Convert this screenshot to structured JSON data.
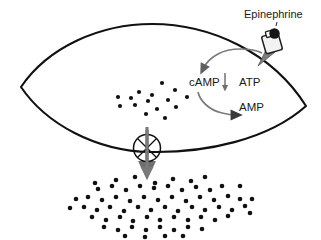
{
  "diagram": {
    "type": "cell-signaling-schematic",
    "background_color": "#ffffff",
    "labels": {
      "epinephrine": "Epinephrine",
      "camp": "cAMP",
      "atp": "ATP",
      "amp": "AMP"
    },
    "colors": {
      "outline": "#111111",
      "text": "#1a1a1a",
      "arrow_gray": "#6e6e6e",
      "arrow_gray_light": "#8a8a8a",
      "dot": "#111111",
      "receptor_fill": "#f2f2f2",
      "ligand_fill": "#161616"
    },
    "elements": {
      "cell_membrane": {
        "name": "cell-membrane-outline",
        "shape": "lens",
        "left_tip": [
          21,
          87
        ],
        "right_tip": [
          306,
          106
        ],
        "top_apex": [
          150,
          24
        ],
        "bottom_apex": [
          150,
          152
        ],
        "stroke_width": 2.1
      },
      "receptor": {
        "name": "membrane-receptor",
        "position": [
          272,
          42
        ],
        "shape": "transmembrane-protein"
      },
      "ligand": {
        "name": "epinephrine-ligand",
        "position": [
          274,
          35
        ],
        "radius": 5.2
      },
      "channel": {
        "name": "membrane-channel-pore",
        "center": [
          147,
          148
        ],
        "radius": 13.5
      },
      "efflux_arrow": {
        "name": "efflux-arrow",
        "from": [
          147,
          127
        ],
        "to": [
          147,
          176
        ],
        "color": "#7a7a7a"
      },
      "camp_down_arrow": {
        "name": "camp-decrease-arrow",
        "from": [
          225,
          74
        ],
        "to": [
          225,
          90
        ]
      }
    },
    "arcs": [
      {
        "name": "atp-to-camp-arc",
        "from_label": "ATP",
        "to_label": "cAMP",
        "direction": "counterclockwise-left"
      },
      {
        "name": "camp-to-amp-arc",
        "from_label": "cAMP",
        "to_label": "AMP",
        "direction": "clockwise-right"
      }
    ],
    "dots_inside": [
      [
        162,
        83
      ],
      [
        139,
        92
      ],
      [
        152,
        95
      ],
      [
        175,
        90
      ],
      [
        118,
        97
      ],
      [
        131,
        98
      ],
      [
        148,
        101
      ],
      [
        168,
        100
      ],
      [
        187,
        97
      ],
      [
        120,
        106
      ],
      [
        135,
        105
      ],
      [
        157,
        109
      ],
      [
        176,
        107
      ],
      [
        146,
        114
      ],
      [
        165,
        118
      ]
    ],
    "dots_outside": [
      [
        116,
        180
      ],
      [
        135,
        177
      ],
      [
        155,
        183
      ],
      [
        173,
        179
      ],
      [
        191,
        181
      ],
      [
        205,
        177
      ],
      [
        98,
        189
      ],
      [
        112,
        186
      ],
      [
        126,
        190
      ],
      [
        140,
        186
      ],
      [
        154,
        188
      ],
      [
        168,
        186
      ],
      [
        182,
        190
      ],
      [
        196,
        187
      ],
      [
        210,
        190
      ],
      [
        222,
        186
      ],
      [
        88,
        197
      ],
      [
        102,
        200
      ],
      [
        116,
        197
      ],
      [
        130,
        201
      ],
      [
        144,
        197
      ],
      [
        158,
        200
      ],
      [
        172,
        197
      ],
      [
        186,
        201
      ],
      [
        200,
        197
      ],
      [
        214,
        200
      ],
      [
        228,
        196
      ],
      [
        240,
        199
      ],
      [
        84,
        207
      ],
      [
        97,
        210
      ],
      [
        110,
        207
      ],
      [
        124,
        211
      ],
      [
        138,
        207
      ],
      [
        151,
        210
      ],
      [
        165,
        207
      ],
      [
        178,
        211
      ],
      [
        192,
        207
      ],
      [
        205,
        210
      ],
      [
        219,
        207
      ],
      [
        232,
        210
      ],
      [
        245,
        206
      ],
      [
        92,
        217
      ],
      [
        106,
        220
      ],
      [
        120,
        217
      ],
      [
        133,
        221
      ],
      [
        147,
        217
      ],
      [
        160,
        220
      ],
      [
        174,
        217
      ],
      [
        188,
        220
      ],
      [
        201,
        217
      ],
      [
        215,
        220
      ],
      [
        228,
        216
      ],
      [
        104,
        227
      ],
      [
        118,
        230
      ],
      [
        132,
        227
      ],
      [
        146,
        230
      ],
      [
        160,
        227
      ],
      [
        174,
        230
      ],
      [
        188,
        227
      ],
      [
        202,
        229
      ],
      [
        125,
        236
      ],
      [
        145,
        237
      ],
      [
        165,
        236
      ],
      [
        183,
        236
      ],
      [
        95,
        183
      ],
      [
        240,
        186
      ],
      [
        252,
        199
      ],
      [
        76,
        199
      ],
      [
        70,
        208
      ],
      [
        250,
        213
      ]
    ]
  }
}
